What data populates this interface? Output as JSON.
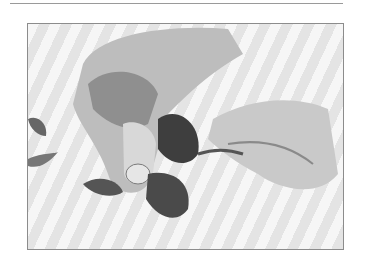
{
  "image": {
    "alt": "Hands picking mint leaves from a stem (black and white photograph)",
    "style": "grayscale",
    "subject": "hands-stripping-mint-leaves"
  },
  "colors": {
    "background": "#ffffff",
    "frame_border": "#8c8c8c",
    "rule": "#9a9a9a"
  }
}
